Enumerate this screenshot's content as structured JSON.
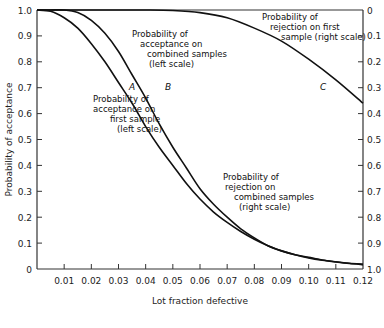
{
  "chart_data": {
    "type": "line",
    "title": "",
    "xlabel": "Lot fraction defective",
    "ylabel": "Probability of acceptance",
    "y2label": "",
    "xlim": [
      0,
      0.12
    ],
    "ylim": [
      0,
      1.0
    ],
    "y2lim": [
      1.0,
      0
    ],
    "grid": false,
    "x_ticks": [
      "0.01",
      "0.02",
      "0.03",
      "0.04",
      "0.05",
      "0.06",
      "0.07",
      "0.08",
      "0.09",
      "0.10",
      "0.11",
      "0.12"
    ],
    "y_ticks": [
      "0",
      "0.1",
      "0.2",
      "0.3",
      "0.4",
      "0.5",
      "0.6",
      "0.7",
      "0.8",
      "0.9",
      "1.0"
    ],
    "y2_ticks": [
      "0",
      "0.1",
      "0.2",
      "0.3",
      "0.4",
      "0.5",
      "0.6",
      "0.7",
      "0.8",
      "0.9",
      "1.0"
    ],
    "series": [
      {
        "name": "A",
        "label": "Probability of acceptance on first sample (left scale)",
        "x": [
          0.0,
          0.005,
          0.01,
          0.015,
          0.02,
          0.025,
          0.03,
          0.035,
          0.04,
          0.045,
          0.05,
          0.055,
          0.06,
          0.065,
          0.07,
          0.075,
          0.08,
          0.085,
          0.09,
          0.095,
          0.1,
          0.105,
          0.11,
          0.115,
          0.12
        ],
        "values": [
          1.0,
          0.995,
          0.97,
          0.93,
          0.87,
          0.8,
          0.72,
          0.64,
          0.55,
          0.47,
          0.4,
          0.33,
          0.27,
          0.22,
          0.18,
          0.145,
          0.115,
          0.09,
          0.07,
          0.055,
          0.045,
          0.035,
          0.028,
          0.022,
          0.018
        ]
      },
      {
        "name": "B",
        "label": "Probability of acceptance on combined samples (left scale)",
        "x": [
          0.0,
          0.005,
          0.01,
          0.015,
          0.02,
          0.025,
          0.03,
          0.035,
          0.04,
          0.045,
          0.05,
          0.055,
          0.06,
          0.065,
          0.07,
          0.075,
          0.08,
          0.085,
          0.09,
          0.095,
          0.1,
          0.105,
          0.11,
          0.115,
          0.12
        ],
        "values": [
          1.0,
          1.0,
          1.0,
          0.99,
          0.96,
          0.91,
          0.84,
          0.75,
          0.66,
          0.56,
          0.47,
          0.39,
          0.31,
          0.25,
          0.2,
          0.155,
          0.12,
          0.09,
          0.07,
          0.055,
          0.043,
          0.034,
          0.027,
          0.021,
          0.017
        ]
      },
      {
        "name": "C",
        "label": "Probability of rejection on first sample (right scale)",
        "x": [
          0.0,
          0.01,
          0.02,
          0.03,
          0.04,
          0.05,
          0.06,
          0.07,
          0.08,
          0.09,
          0.1,
          0.11,
          0.12
        ],
        "values_right_scale": [
          0,
          0,
          0,
          0,
          0,
          0.002,
          0.01,
          0.03,
          0.07,
          0.12,
          0.19,
          0.27,
          0.36
        ],
        "values": [
          1.0,
          1.0,
          1.0,
          1.0,
          1.0,
          0.998,
          0.99,
          0.97,
          0.93,
          0.88,
          0.81,
          0.73,
          0.64
        ]
      }
    ],
    "annotations": [
      {
        "id": "ann_b",
        "lines": [
          "Probability of",
          "acceptance on",
          "combined samples",
          "(left scale)"
        ]
      },
      {
        "id": "ann_a",
        "lines": [
          "Probability of",
          "acceptance on",
          "first sample",
          "(left scale)"
        ]
      },
      {
        "id": "ann_c",
        "lines": [
          "Probability of",
          "rejection on first",
          "sample (right scale)"
        ]
      },
      {
        "id": "ann_rej_comb",
        "lines": [
          "Probability of",
          "rejection on",
          "combined samples",
          "(right scale)"
        ]
      }
    ],
    "curve_letters": [
      "A",
      "B",
      "C"
    ]
  }
}
